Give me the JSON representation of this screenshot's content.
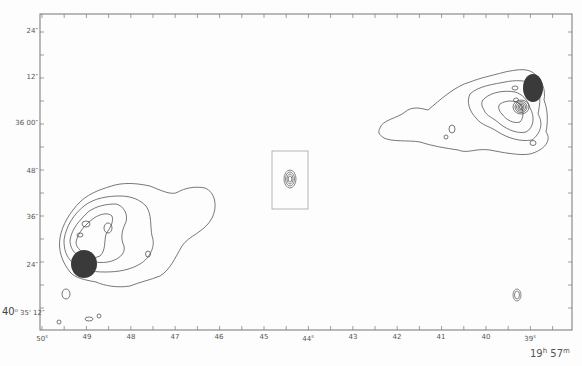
{
  "chart_data": {
    "type": "contour",
    "title": "",
    "xlabel": "19h 57m",
    "ylabel": "40° 35'",
    "x_axis": {
      "unit": "seconds of right ascension (s)",
      "ticks": [
        "50",
        "49",
        "48",
        "47",
        "46",
        "45",
        "44",
        "43",
        "42",
        "41",
        "40",
        "39"
      ],
      "range": [
        50,
        38.1
      ]
    },
    "y_axis": {
      "unit": "arcsec of declination",
      "ticks": [
        "24\"",
        "12\"",
        "36 00\"",
        "48\"",
        "36\"",
        "24\"",
        "12\""
      ],
      "range_note": "from 40° 35' 12\" (bottom) upward"
    },
    "features": [
      {
        "name": "northwest lobe (right)",
        "center_ra_s": 39.0,
        "center_dec": "36 12",
        "has_saturated_hotspot": true,
        "secondary_compact_source": true
      },
      {
        "name": "central core",
        "center_ra_s": 44.5,
        "center_dec": "35 47",
        "boxed": true
      },
      {
        "name": "southeast lobe (left)",
        "center_ra_s": 49.0,
        "center_dec": "35 24",
        "has_saturated_hotspot": true
      },
      {
        "name": "beam ellipse",
        "center_ra_s": 39.3,
        "center_dec": "35 18"
      }
    ],
    "grid": false,
    "legend": null
  },
  "axes": {
    "y_labels": [
      {
        "text": "24″",
        "y": 32
      },
      {
        "text": "12″",
        "y": 78
      },
      {
        "text": "36  00″",
        "y": 124
      },
      {
        "text": "48″",
        "y": 172
      },
      {
        "text": "36″",
        "y": 218
      },
      {
        "text": "24″",
        "y": 266
      }
    ],
    "y_bottom_prefix": "40",
    "y_bottom_deg": "o",
    "y_bottom_rest": "35' 12″",
    "x_labels": [
      {
        "text": "50",
        "sup": "s",
        "x": 42
      },
      {
        "text": "49",
        "sup": "",
        "x": 87
      },
      {
        "text": "48",
        "sup": "",
        "x": 131
      },
      {
        "text": "47",
        "sup": "",
        "x": 175
      },
      {
        "text": "46",
        "sup": "",
        "x": 219
      },
      {
        "text": "45",
        "sup": "",
        "x": 264
      },
      {
        "text": "44",
        "sup": "s",
        "x": 308
      },
      {
        "text": "43",
        "sup": "",
        "x": 353
      },
      {
        "text": "42",
        "sup": "",
        "x": 397
      },
      {
        "text": "41",
        "sup": "",
        "x": 441
      },
      {
        "text": "40",
        "sup": "",
        "x": 486
      },
      {
        "text": "39",
        "sup": "s",
        "x": 530
      }
    ],
    "ra_hours": "19",
    "ra_h_sup": "h",
    "ra_minutes": "57",
    "ra_m_sup": "m"
  },
  "colors": {
    "line": "#555555",
    "fill": "#3a3a3a",
    "axis": "#666666"
  }
}
